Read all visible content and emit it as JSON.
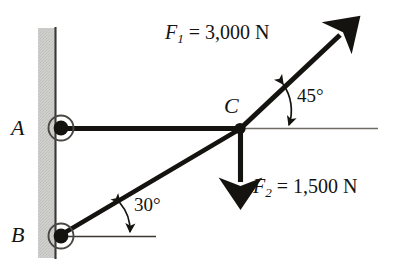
{
  "figure": {
    "background_color": "#ffffff",
    "ink_color": "#15130f",
    "wall_fill_color": "#cbcbc9",
    "wall_edge_color": "#3a3733",
    "thin_line_color": "#6f6c68"
  },
  "points": {
    "a": {
      "label": "A",
      "name": "support-a"
    },
    "b": {
      "label": "B",
      "name": "support-b"
    },
    "c": {
      "label": "C",
      "name": "joint-c"
    }
  },
  "angles": {
    "upper": {
      "label": "45°",
      "value": 45,
      "units": "degrees",
      "measured_from": "horizontal",
      "at": "C"
    },
    "lower": {
      "label": "30°",
      "value": 30,
      "units": "degrees",
      "measured_from": "horizontal",
      "at": "B"
    }
  },
  "forces": {
    "f1": {
      "symbol": "F",
      "subscript": "1",
      "equals": "=",
      "value": "3,000 N",
      "magnitude": 3000,
      "units": "N",
      "direction": "up and to the right at 45° from horizontal",
      "full_label": "F1 = 3,000 N"
    },
    "f2": {
      "symbol": "F",
      "subscript": "2",
      "equals": "=",
      "value": "1,500 N",
      "magnitude": 1500,
      "units": "N",
      "direction": "vertically downward",
      "full_label": "F2 = 1,500 N"
    }
  },
  "members": {
    "ac": {
      "name": "member-ac",
      "from": "A",
      "to": "C",
      "orientation": "horizontal"
    },
    "bc": {
      "name": "member-bc",
      "from": "B",
      "to": "C",
      "orientation": "30 degrees above horizontal"
    }
  }
}
